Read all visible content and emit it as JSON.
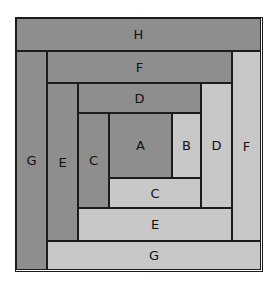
{
  "diagram": {
    "colors": {
      "dark": "#8e8e8e",
      "light": "#c8c8c8",
      "line": "#1c1c1c"
    },
    "pieces": {
      "h_top": {
        "label": "H",
        "tone": "dark"
      },
      "g_left": {
        "label": "G",
        "tone": "dark"
      },
      "f_top": {
        "label": "F",
        "tone": "dark"
      },
      "f_right": {
        "label": "F",
        "tone": "light"
      },
      "g_bottom": {
        "label": "G",
        "tone": "light"
      },
      "e_left": {
        "label": "E",
        "tone": "dark"
      },
      "d_top": {
        "label": "D",
        "tone": "dark"
      },
      "d_right": {
        "label": "D",
        "tone": "light"
      },
      "e_bottom": {
        "label": "E",
        "tone": "light"
      },
      "c_left": {
        "label": "C",
        "tone": "dark"
      },
      "a_center": {
        "label": "A",
        "tone": "dark"
      },
      "b_right": {
        "label": "B",
        "tone": "light"
      },
      "c_bottom": {
        "label": "C",
        "tone": "light"
      }
    }
  }
}
